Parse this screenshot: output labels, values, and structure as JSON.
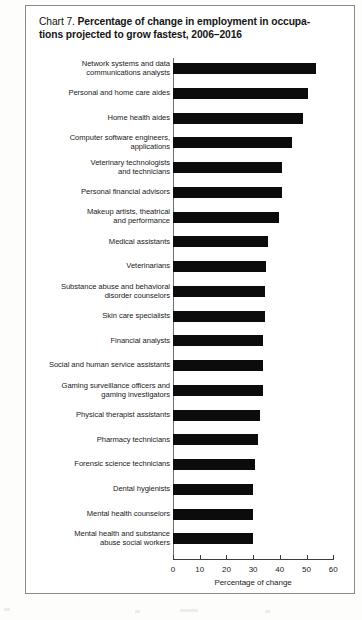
{
  "figure": {
    "label": "Chart 7.",
    "title_line1": "Percentage of change in employment in occupa-",
    "title_line2": "tions projected to grow fastest,  2006–2016"
  },
  "chart_data": {
    "type": "bar",
    "orientation": "horizontal",
    "xlabel": "Percentage of change",
    "ylabel": "",
    "xlim": [
      0,
      60
    ],
    "xticks": [
      0,
      10,
      20,
      30,
      40,
      50,
      60
    ],
    "xticklabels": [
      "0",
      "10",
      "20",
      "30",
      "40",
      "50",
      "60"
    ],
    "grid": false,
    "legend": false,
    "bar_color": "#0c0c0c",
    "categories": [
      "Network systems and data communications analysts",
      "Personal and home care aides",
      "Home health aides",
      "Computer software engineers, applications",
      "Veterinary technologists and technicians",
      "Personal financial advisors",
      "Makeup artists, theatrical and performance",
      "Medical assistants",
      "Veterinarians",
      "Substance abuse and behavioral disorder counselors",
      "Skin care specialists",
      "Financial analysts",
      "Social and human service assistants",
      "Gaming surveillance officers and gaming investigators",
      "Physical therapist assistants",
      "Pharmacy technicians",
      "Forensic science technicians",
      "Dental hygienists",
      "Mental health counselors",
      "Mental health and substance abuse social workers"
    ],
    "category_lines": [
      [
        "Network systems and data",
        "communications analysts"
      ],
      [
        "Personal and home care aides"
      ],
      [
        "Home health aides"
      ],
      [
        "Computer software engineers,",
        "applications"
      ],
      [
        "Veterinary technologists",
        "and technicians"
      ],
      [
        "Personal financial advisors"
      ],
      [
        "Makeup artists, theatrical",
        "and performance"
      ],
      [
        "Medical assistants"
      ],
      [
        "Veterinarians"
      ],
      [
        "Substance abuse and behavioral",
        "disorder counselors"
      ],
      [
        "Skin care specialists"
      ],
      [
        "Financial analysts"
      ],
      [
        "Social and human service assistants"
      ],
      [
        "Gaming surveillance officers and",
        "gaming investigators"
      ],
      [
        "Physical therapist assistants"
      ],
      [
        "Pharmacy technicians"
      ],
      [
        "Forensic science technicians"
      ],
      [
        "Dental hygienists"
      ],
      [
        "Mental health counselors"
      ],
      [
        "Mental health and substance",
        "abuse social workers"
      ]
    ],
    "values": [
      53.4,
      50.6,
      48.7,
      44.6,
      41.0,
      41.0,
      39.8,
      35.4,
      35.0,
      34.3,
      34.3,
      33.8,
      33.6,
      33.6,
      32.4,
      32.0,
      30.7,
      30.1,
      30.0,
      29.9
    ]
  }
}
